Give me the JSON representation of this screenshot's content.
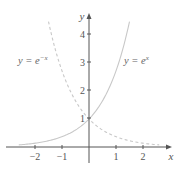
{
  "chart_data": {
    "type": "line",
    "title": "",
    "xlabel": "x",
    "ylabel": "y",
    "xlim": [
      -2.6,
      2.6
    ],
    "ylim": [
      0,
      4.7
    ],
    "grid": false,
    "x_ticks": [
      {
        "value": -2,
        "label": "−2"
      },
      {
        "value": -1,
        "label": "−1"
      },
      {
        "value": 1,
        "label": "1"
      },
      {
        "value": 2,
        "label": "2"
      }
    ],
    "y_ticks": [
      {
        "value": 1,
        "label": "1"
      },
      {
        "value": 2,
        "label": "2"
      },
      {
        "value": 3,
        "label": "3"
      },
      {
        "value": 4,
        "label": "4"
      }
    ],
    "series": [
      {
        "name": "y = e^x",
        "style": "solid",
        "color": "#c8c8c8",
        "x": [
          -2.6,
          -2,
          -1.5,
          -1,
          -0.5,
          0,
          0.5,
          1,
          1.25,
          1.5
        ],
        "y": [
          0.074,
          0.135,
          0.223,
          0.368,
          0.607,
          1.0,
          1.649,
          2.718,
          3.49,
          4.48
        ]
      },
      {
        "name": "y = e^{-x}",
        "style": "dashed",
        "color": "#c8c8c8",
        "x": [
          -1.5,
          -1.25,
          -1,
          -0.5,
          0,
          0.5,
          1,
          1.5,
          2,
          2.6
        ],
        "y": [
          4.48,
          3.49,
          2.718,
          1.649,
          1.0,
          0.607,
          0.368,
          0.223,
          0.135,
          0.074
        ]
      }
    ],
    "annotations": [
      {
        "text_base": "y = e",
        "superscript": "−x",
        "position": "upper-left",
        "series": "y = e^{-x}"
      },
      {
        "text_base": "y = e",
        "superscript": "x",
        "position": "upper-right",
        "series": "y = e^x"
      }
    ]
  },
  "labels": {
    "x_axis": "x",
    "y_axis": "y",
    "left_curve_base": "y = e",
    "left_curve_sup": "−x",
    "right_curve_base": "y = e",
    "right_curve_sup": "x",
    "xt_m2": "−2",
    "xt_m1": "−1",
    "xt_1": "1",
    "xt_2": "2",
    "yt_1": "1",
    "yt_2": "2",
    "yt_3": "3",
    "yt_4": "4"
  }
}
